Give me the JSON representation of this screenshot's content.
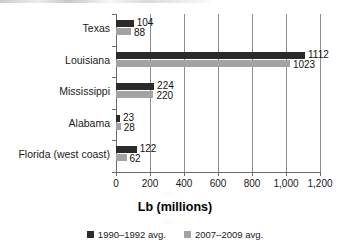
{
  "chart_data": {
    "type": "bar",
    "orientation": "horizontal",
    "title": "",
    "xlabel": "Lb (millions)",
    "ylabel": "",
    "xlim": [
      0,
      1200
    ],
    "xticks": [
      0,
      200,
      400,
      600,
      800,
      1000,
      1200
    ],
    "xtick_labels": [
      "0",
      "200",
      "400",
      "600",
      "800",
      "1,000",
      "1,200"
    ],
    "grid": "vertical",
    "legend_position": "bottom",
    "categories": [
      "Texas",
      "Louisiana",
      "Mississippi",
      "Alabama",
      "Florida (west coast)"
    ],
    "series": [
      {
        "name": "1990–1992 avg.",
        "color": "#2b2b2b",
        "values": [
          104,
          1112,
          224,
          23,
          122
        ],
        "value_labels": [
          "104",
          "1112",
          "224",
          "23",
          "122"
        ]
      },
      {
        "name": "2007–2009 avg.",
        "color": "#a3a3a3",
        "values": [
          88,
          1023,
          220,
          28,
          62
        ],
        "value_labels": [
          "88",
          "1023",
          "220",
          "28",
          "62"
        ]
      }
    ]
  }
}
